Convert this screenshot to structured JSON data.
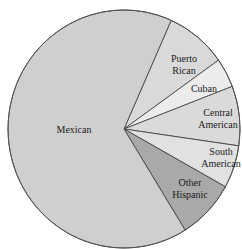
{
  "chart_data": {
    "type": "pie",
    "title": "",
    "start_angle_deg": 66,
    "direction": "clockwise",
    "categories": [
      "Mexican",
      "Puerto Rican",
      "Cuban",
      "Central American",
      "South American",
      "Other Hispanic"
    ],
    "values": [
      65.5,
      8.5,
      4.0,
      8.1,
      5.8,
      8.1
    ],
    "unit": "percent (estimated from slice angles)",
    "slices": [
      {
        "key": "puerto_rican",
        "label_lines": [
          "Puerto",
          "Rican"
        ],
        "value": 8.5,
        "color": "#d9d9d9",
        "label_pos": [
          184,
          62
        ]
      },
      {
        "key": "cuban",
        "label_lines": [
          "Cuban"
        ],
        "value": 4.0,
        "color": "#ececec",
        "label_pos": [
          204,
          92
        ]
      },
      {
        "key": "central_american",
        "label_lines": [
          "Central",
          "American"
        ],
        "value": 8.1,
        "color": "#dadada",
        "label_pos": [
          218,
          116
        ]
      },
      {
        "key": "south_american",
        "label_lines": [
          "South",
          "American"
        ],
        "value": 5.8,
        "color": "#e1e1e1",
        "label_pos": [
          221,
          155
        ]
      },
      {
        "key": "other_hispanic",
        "label_lines": [
          "Other",
          "Hispanic"
        ],
        "value": 8.1,
        "color": "#a9a9a9",
        "label_pos": [
          190,
          186
        ]
      },
      {
        "key": "mexican",
        "label_lines": [
          "Mexican"
        ],
        "value": 65.5,
        "color": "#cfcfcf",
        "label_pos": [
          74,
          133
        ]
      }
    ],
    "geometry": {
      "cx": 124,
      "cy": 129,
      "rx": 116,
      "ry": 119
    },
    "legend": "none (labels inside slices)"
  }
}
